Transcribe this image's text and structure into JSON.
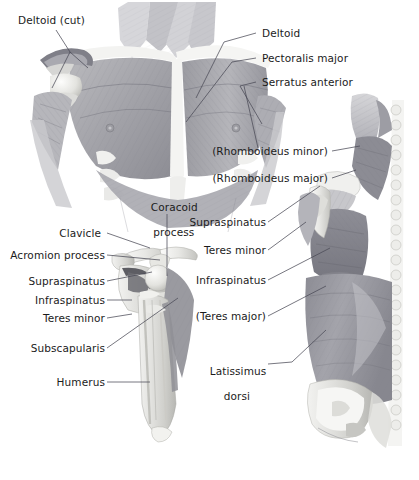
{
  "figure": {
    "background_color": "#ffffff",
    "label_color": "#1b1b1b",
    "leader_line_color": "#4a4a55",
    "style": "grayscale medical illustration"
  },
  "panels": [
    {
      "id": "anterior-thorax",
      "name": "Anterior thoracic / pectoral view"
    },
    {
      "id": "anterior-scapula-skeleton",
      "name": "Anterior scapula and humerus skeletal view"
    },
    {
      "id": "posterior-trunk",
      "name": "Posterior trunk and scapula view"
    }
  ],
  "labels": {
    "deltoid_cut": "Deltoid (cut)",
    "deltoid": "Deltoid",
    "pectoralis_major": "Pectoralis major",
    "serratus_anterior": "Serratus anterior",
    "rhomboideus_minor": "(Rhomboideus minor)",
    "rhomboideus_major": "(Rhomboideus major)",
    "coracoid_process_l1": "Coracoid",
    "coracoid_process_l2": "process",
    "clavicle": "Clavicle",
    "acromion_process": "Acromion process",
    "supraspinatus_left": "Supraspinatus",
    "infraspinatus_left": "Infraspinatus",
    "teres_minor_left": "Teres minor",
    "subscapularis": "Subscapularis",
    "humerus": "Humerus",
    "supraspinatus_right": "Supraspinatus",
    "teres_minor_right": "Teres minor",
    "infraspinatus_right": "Infraspinatus",
    "teres_major": "(Teres major)",
    "latissimus_dorsi_l1": "Latissimus",
    "latissimus_dorsi_l2": "dorsi"
  }
}
